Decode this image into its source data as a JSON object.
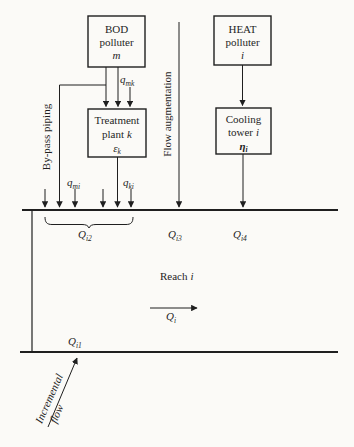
{
  "figure": {
    "background": "#fbfaf7",
    "ink": "#1f1f1f"
  },
  "boxes": {
    "bod_polluter": {
      "title": "BOD",
      "subtitle": "polluter",
      "variable": "m"
    },
    "heat_polluter": {
      "title": "HEAT",
      "subtitle": "polluter",
      "variable": "i"
    },
    "treatment_plant": {
      "title": "Treatment",
      "subtitle": "plant",
      "subtitle_var": "k",
      "symbol": "ε",
      "symbol_sub": "k"
    },
    "cooling_tower": {
      "title": "Cooling",
      "subtitle": "tower",
      "subtitle_var": "i",
      "symbol": "η",
      "symbol_sub": "i"
    }
  },
  "flow_labels": {
    "q_mk": {
      "base": "q",
      "sub": "mk"
    },
    "q_mi": {
      "base": "q",
      "sub": "mi"
    },
    "q_ki": {
      "base": "q",
      "sub": "ki"
    }
  },
  "river_labels": {
    "Q_i1": {
      "base": "Q",
      "sub": "i1"
    },
    "Q_i2": {
      "base": "Q",
      "sub": "i2"
    },
    "Q_i3": {
      "base": "Q",
      "sub": "i3"
    },
    "Q_i4": {
      "base": "Q",
      "sub": "i4"
    },
    "Q_i": {
      "base": "Q",
      "sub": "i"
    },
    "reach": "Reach",
    "reach_var": "i"
  },
  "annotations": {
    "bypass_piping": "By-pass piping",
    "flow_augmentation": "Flow augmentation",
    "incremental_line1": "Incremental",
    "incremental_line2": "flow"
  }
}
